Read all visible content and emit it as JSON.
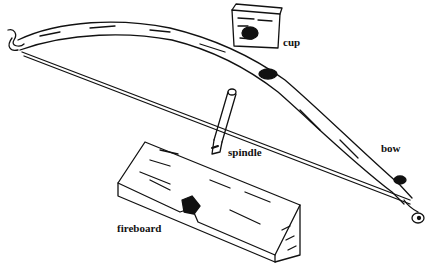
{
  "labels": {
    "cup": "cup",
    "bow": "bow",
    "spindle": "spindle",
    "fireboard": "fireboard"
  }
}
